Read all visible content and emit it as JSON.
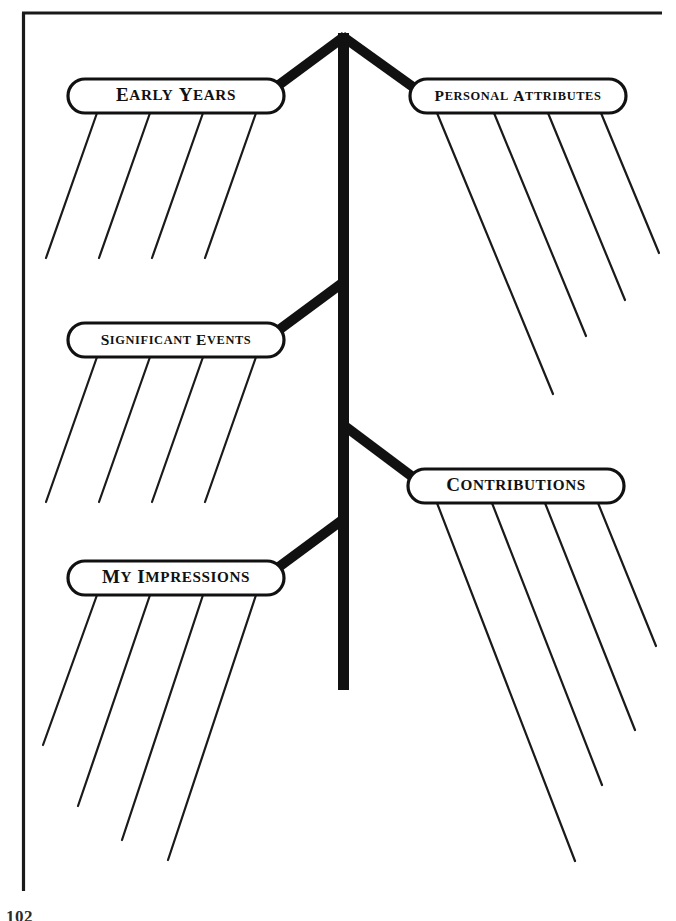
{
  "document": {
    "type": "graphic-organizer-worksheet",
    "layout": "biography-tree-diagram",
    "page_number_partial": "102",
    "frame_color": "#1a1a1a",
    "ink_color": "#111111",
    "background_color": "#ffffff"
  },
  "diagram": {
    "title_trunk_name": "tree-trunk",
    "trunk": {
      "x": 343,
      "top_y": 33,
      "bottom_y": 690,
      "width": 11
    },
    "nodes": [
      {
        "id": "early-years",
        "label": "Early Years",
        "side": "left",
        "bubble": {
          "cx": 176,
          "cy": 96,
          "w": 216,
          "h": 34
        },
        "leaf_count": 4,
        "leaf_direction": "down-left",
        "leaf_length": 152
      },
      {
        "id": "personal-attributes",
        "label": "Personal Attributes",
        "side": "right",
        "bubble": {
          "cx": 518,
          "cy": 96,
          "w": 216,
          "h": 34
        },
        "leaf_count": 4,
        "leaf_direction": "down-right",
        "leaf_length": 300
      },
      {
        "id": "significant-events",
        "label": "Significant Events",
        "side": "left",
        "bubble": {
          "cx": 176,
          "cy": 340,
          "w": 216,
          "h": 34
        },
        "leaf_count": 4,
        "leaf_direction": "down-left",
        "leaf_length": 152
      },
      {
        "id": "contributions",
        "label": "Contributions",
        "side": "right",
        "bubble": {
          "cx": 516,
          "cy": 485,
          "w": 216,
          "h": 34
        },
        "leaf_count": 4,
        "leaf_direction": "down-right",
        "leaf_length": 346
      },
      {
        "id": "my-impressions",
        "label": "My Impressions",
        "side": "left",
        "bubble": {
          "cx": 176,
          "cy": 578,
          "w": 216,
          "h": 34
        },
        "leaf_count": 4,
        "leaf_direction": "down-left",
        "leaf_length": 260
      }
    ]
  }
}
